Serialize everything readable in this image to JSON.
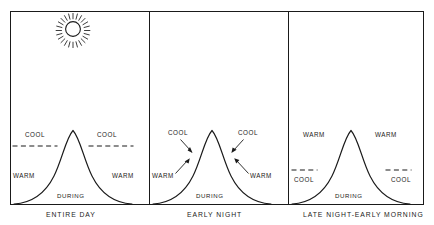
{
  "figure": {
    "background": "#ffffff",
    "ink_color": "#1a1a1a"
  },
  "icons": {
    "sun": "sun-icon"
  },
  "during_label": "DURING",
  "panels": [
    {
      "id": "entire-day",
      "caption": "ENTIRE DAY",
      "during": "DURING",
      "has_sun": true,
      "threshold_level": "high",
      "labels": {
        "left_upper": "COOL",
        "right_upper": "COOL",
        "left_lower": "WARM",
        "right_lower": "WARM"
      },
      "arrows": false
    },
    {
      "id": "early-night",
      "caption": "EARLY NIGHT",
      "during": "DURING",
      "has_sun": false,
      "threshold_level": "none",
      "labels": {
        "left_upper": "COOL",
        "right_upper": "COOL",
        "left_lower": "WARM",
        "right_lower": "WARM"
      },
      "arrows": true
    },
    {
      "id": "late-night-early-morning",
      "caption": "LATE NIGHT-EARLY MORNING",
      "during": "DURING",
      "has_sun": false,
      "threshold_level": "low",
      "labels": {
        "left_upper": "WARM",
        "right_upper": "WARM",
        "left_lower": "COOL",
        "right_lower": "COOL"
      },
      "arrows": false
    }
  ]
}
